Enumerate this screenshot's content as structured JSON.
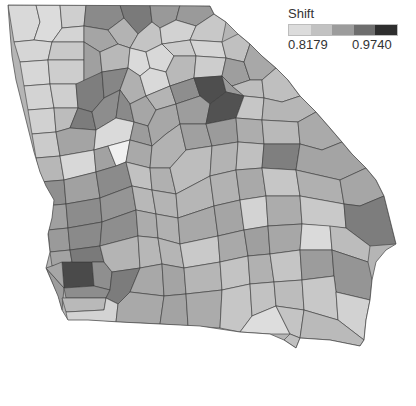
{
  "map": {
    "title": "Georgia counties choropleth",
    "region": "Georgia"
  },
  "legend": {
    "title": "Shift",
    "min_label": "0.8179",
    "max_label": "0.9740",
    "bins": [
      "#dcdcdc",
      "#c2c2c2",
      "#9c9c9c",
      "#6e6e6e",
      "#2e2e2e"
    ]
  },
  "palette": {
    "c1": "#d9d9d9",
    "c2": "#bfbfbf",
    "c3": "#a3a3a3",
    "c4": "#8a8a8a",
    "c5": "#5a5a5a",
    "border": "#3a3a3a"
  }
}
